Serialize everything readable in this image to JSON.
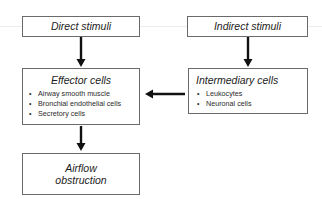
{
  "diagram": {
    "boxes": {
      "direct": {
        "title": "Direct stimuli"
      },
      "indirect": {
        "title": "Indirect stimuli"
      },
      "effector": {
        "title": "Effector cells",
        "items": [
          "Airway smooth muscle",
          "Bronchial endothelial cells",
          "Secretory cells"
        ]
      },
      "intermediary": {
        "title": "Intermediary cells",
        "items": [
          "Leukocytes",
          "Neuronal cells"
        ]
      },
      "outcome": {
        "title_line1": "Airflow",
        "title_line2": "obstruction"
      }
    },
    "edges": [
      {
        "from": "Direct stimuli",
        "to": "Effector cells"
      },
      {
        "from": "Indirect stimuli",
        "to": "Intermediary cells"
      },
      {
        "from": "Intermediary cells",
        "to": "Effector cells"
      },
      {
        "from": "Effector cells",
        "to": "Airflow obstruction"
      }
    ],
    "colors": {
      "border": "#6a6a6a",
      "arrow": "#111111",
      "text": "#1c1c1c"
    }
  }
}
